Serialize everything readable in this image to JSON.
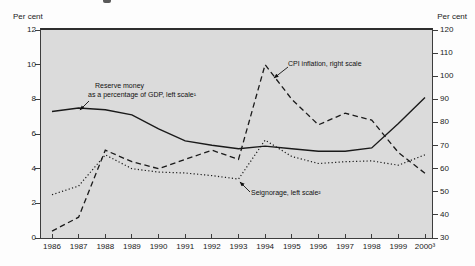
{
  "page": {
    "left_axis_title": "Per cent",
    "right_axis_title": "Per cent"
  },
  "annotations": {
    "reserve_line1": "Reserve money",
    "reserve_line2": "as a percentage of GDP, left scale¹",
    "cpi": "CPI inflation, right scale",
    "seignorage": "Seignorage, left scale²"
  },
  "colors": {
    "line": "#1a1a1a",
    "plot_background": "#dbdbdb",
    "axis": "#3d3d3d"
  },
  "chart_data": {
    "type": "line",
    "title": "",
    "categories": [
      "1986",
      "1987",
      "1988",
      "1989",
      "1990",
      "1991",
      "1992",
      "1993",
      "1994",
      "1995",
      "1996",
      "1997",
      "1998",
      "1999",
      "2000³"
    ],
    "left_axis": {
      "title": "Per cent",
      "range": [
        0,
        12
      ],
      "ticks": [
        12,
        10,
        8,
        6,
        4,
        2,
        0
      ]
    },
    "right_axis": {
      "title": "Per cent",
      "range": [
        30,
        120
      ],
      "ticks": [
        120,
        110,
        100,
        90,
        80,
        70,
        60,
        50,
        40,
        30
      ]
    },
    "grid": false,
    "legend_position": "in-plot-annotations",
    "series": [
      {
        "name": "Reserve money as a percentage of GDP",
        "scale": "left",
        "style": "solid",
        "values": [
          7.3,
          7.5,
          7.4,
          7.1,
          6.3,
          5.6,
          5.35,
          5.15,
          5.3,
          5.15,
          5.0,
          5.0,
          5.2,
          6.6,
          8.1
        ]
      },
      {
        "name": "CPI inflation",
        "scale": "right",
        "style": "dashed",
        "values": [
          33,
          39,
          68,
          63,
          60,
          64,
          68,
          64,
          105,
          90,
          79,
          84,
          81,
          67,
          58
        ]
      },
      {
        "name": "Seignorage",
        "scale": "left",
        "style": "dotted",
        "values": [
          2.5,
          3.0,
          4.8,
          4.0,
          3.8,
          3.75,
          3.6,
          3.4,
          5.65,
          4.7,
          4.3,
          4.4,
          4.45,
          4.2,
          4.8
        ]
      }
    ]
  }
}
